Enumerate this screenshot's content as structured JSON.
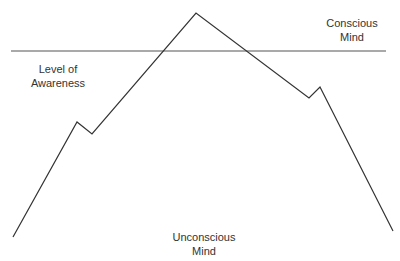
{
  "diagram": {
    "labels": {
      "conscious_line1": "Conscious",
      "conscious_line2": "Mind",
      "awareness_line1": "Level of",
      "awareness_line2": "Awareness",
      "unconscious_line1": "Unconscious",
      "unconscious_line2": "Mind"
    },
    "line_color": "#333333"
  }
}
